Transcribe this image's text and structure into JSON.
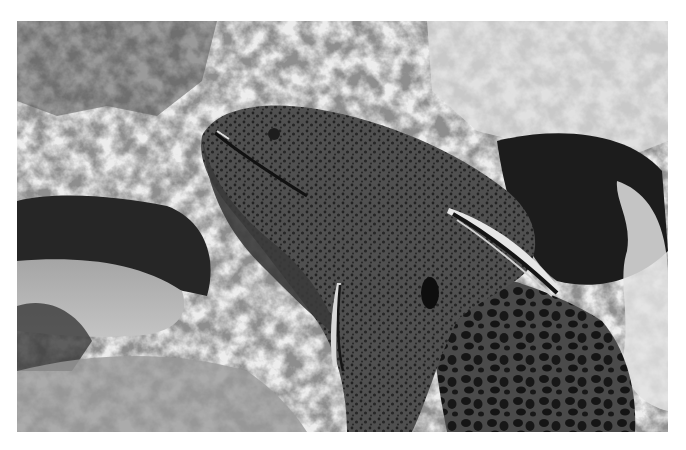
{
  "image": {
    "subject": "moray eel with cleaner fish among coral reef",
    "style": "grayscale photograph",
    "frame": {
      "x": 17,
      "y": 21,
      "width": 651,
      "height": 411
    },
    "background": "#ffffff",
    "tones": {
      "eel_body": "#4a4a4a",
      "eel_dark": "#2e2e2e",
      "eel_spots": "#1c1c1c",
      "coral_light": "#d8d8d8",
      "coral_mid": "#a8a8a8",
      "cave_dark": "#1e1e1e",
      "sand": "#bdbdbd",
      "fish_stripe_light": "#e6e6e6",
      "fish_stripe_dark": "#141414"
    },
    "elements": [
      "moray-eel-head",
      "moray-eel-body-leopard-pattern",
      "cleaner-fish-upper",
      "cleaner-fish-lower",
      "coral-reef-left",
      "coral-reef-right",
      "dark-cave",
      "sandy-floor"
    ]
  }
}
